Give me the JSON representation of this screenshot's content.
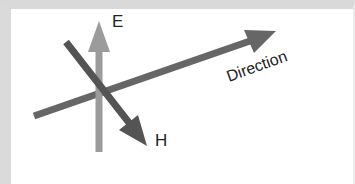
{
  "diagram": {
    "labels": {
      "e_field": "E",
      "h_field": "H",
      "direction": "Direction"
    },
    "arrows": [
      {
        "name": "E",
        "color": "#9b9b9b",
        "from": [
          99,
          152
        ],
        "to": [
          99,
          22
        ]
      },
      {
        "name": "H",
        "color": "#545454",
        "from": [
          66,
          42
        ],
        "to": [
          147,
          145
        ]
      },
      {
        "name": "Direction",
        "color": "#666666",
        "from": [
          34,
          116
        ],
        "to": [
          274,
          32
        ]
      }
    ],
    "colors": {
      "background": "#ffffff",
      "frame": "#d9d9d9",
      "text": "#222222"
    }
  }
}
